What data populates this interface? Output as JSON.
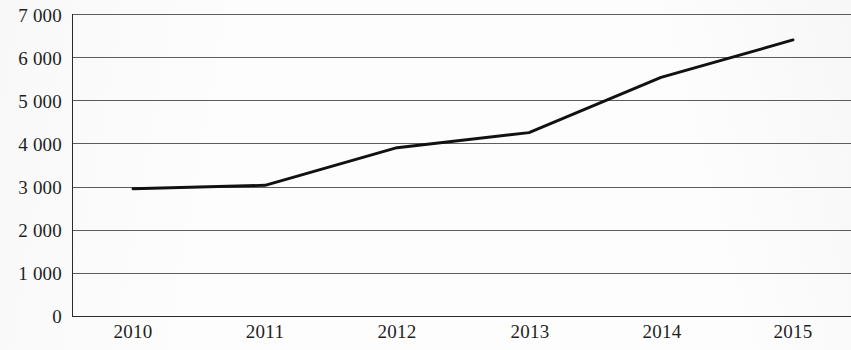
{
  "chart_data": {
    "type": "line",
    "title": "",
    "subtitle": "",
    "xlabel": "",
    "ylabel": "",
    "categories": [
      "2010",
      "2011",
      "2012",
      "2013",
      "2014",
      "2015"
    ],
    "x": [
      2010,
      2011,
      2012,
      2013,
      2014,
      2015
    ],
    "values": [
      2950,
      3030,
      3900,
      4250,
      5530,
      6400
    ],
    "series": [
      {
        "name": "",
        "values": [
          2950,
          3030,
          3900,
          4250,
          5530,
          6400
        ]
      }
    ],
    "ylim": [
      0,
      7000
    ],
    "ytick_values": [
      0,
      1000,
      2000,
      3000,
      4000,
      5000,
      6000,
      7000
    ],
    "ytick_labels": [
      "0",
      "1 000",
      "2 000",
      "3 000",
      "4 000",
      "5 000",
      "6 000",
      "7 000"
    ],
    "xtick_labels": [
      "2010",
      "2011",
      "2012",
      "2013",
      "2014",
      "2015"
    ],
    "grid": true,
    "grid_axis": "y",
    "legend": false,
    "legend_position": "none",
    "annotations": [],
    "colors": {
      "series_line": "#111111",
      "gridline": "#5d5d5d",
      "axis": "#2b2b2b",
      "background": "#fdfdfd",
      "text": "#1f1f1f"
    }
  }
}
